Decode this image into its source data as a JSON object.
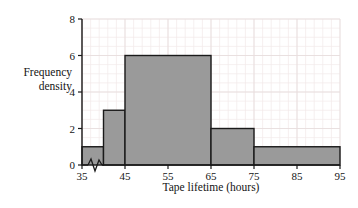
{
  "chart_data": {
    "type": "bar",
    "title": "",
    "xlabel": "Tape lifetime (hours)",
    "ylabel_line1": "Frequency",
    "ylabel_line2": "density",
    "xlim": [
      35,
      95
    ],
    "ylim": [
      0,
      8
    ],
    "grid": true,
    "legend": "none",
    "axis_break": true,
    "xticks": [
      35,
      45,
      55,
      65,
      75,
      85,
      95
    ],
    "yticks": [
      0,
      2,
      4,
      6,
      8
    ],
    "x_minor_step": 2,
    "y_minor_step": 0.5,
    "bin_edges": [
      35,
      40,
      45,
      65,
      75,
      95
    ],
    "values": [
      1,
      3,
      6,
      2,
      1
    ],
    "bins": [
      {
        "start": 35,
        "end": 40,
        "density": 1
      },
      {
        "start": 40,
        "end": 45,
        "density": 3
      },
      {
        "start": 45,
        "end": 65,
        "density": 6
      },
      {
        "start": 65,
        "end": 75,
        "density": 2
      },
      {
        "start": 75,
        "end": 95,
        "density": 1
      }
    ],
    "colors": {
      "bar_fill": "#9a9a9a",
      "bar_edge": "#1a1a1a",
      "axis": "#1a1a1a",
      "grid_major": "#e8dede",
      "grid_minor": "#f2eaea",
      "background": "#ffffff",
      "text": "#141414"
    }
  }
}
